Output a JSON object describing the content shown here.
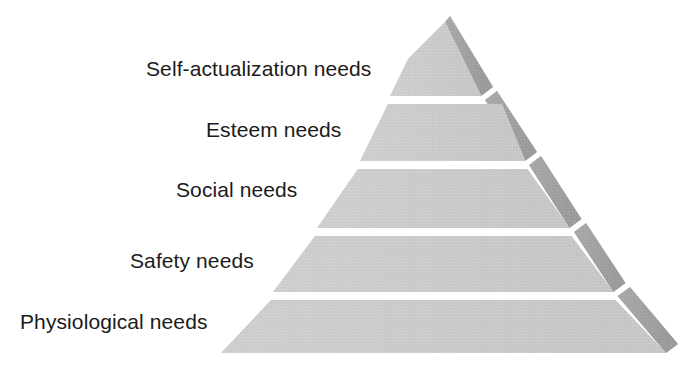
{
  "diagram": {
    "name": "maslow-hierarchy-of-needs-pyramid",
    "type": "pyramid",
    "orientation": "apex-top",
    "background_color": "#ffffff",
    "colors": {
      "front_face": "#c9c9c9",
      "front_face_light": "#d2d2d2",
      "side_face": "#a3a3a3",
      "side_face_dark": "#969696",
      "divider": "#ffffff",
      "label_text": "#1b1b1b"
    },
    "geometry": {
      "apex_x": 445,
      "apex_y": 22,
      "base_left_x": 221,
      "base_right_x": 666,
      "base_y": 353,
      "side_depth_x": 14,
      "side_depth_y": -9,
      "divider_y": [
        100,
        165,
        232,
        296
      ],
      "divider_thickness": 4
    },
    "tiers": [
      {
        "index": 1,
        "rank": "5",
        "label": "Self-actualization needs",
        "position": "top"
      },
      {
        "index": 2,
        "rank": "4",
        "label": "Esteem needs",
        "position": "upper-middle"
      },
      {
        "index": 3,
        "rank": "3",
        "label": "Social needs",
        "position": "middle"
      },
      {
        "index": 4,
        "rank": "2",
        "label": "Safety needs",
        "position": "lower-middle"
      },
      {
        "index": 5,
        "rank": "1",
        "label": "Physiological needs",
        "position": "base"
      }
    ]
  }
}
